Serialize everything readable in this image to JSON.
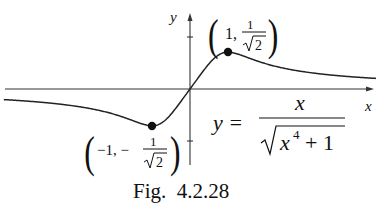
{
  "chart_data": {
    "type": "line",
    "title": "",
    "caption": "Fig.  4.2.28",
    "equation": "y = x / sqrt(x^4 + 1)",
    "xlabel": "x",
    "ylabel": "y",
    "xlim": [
      -4.9,
      4.9
    ],
    "ylim": [
      -1.45,
      1.45
    ],
    "grid": false,
    "y_ticks": [
      -1,
      1
    ],
    "series": [
      {
        "name": "y = x/sqrt(x^4+1)",
        "x": [
          -4.9,
          -4,
          -3,
          -2,
          -1.5,
          -1,
          -0.5,
          0,
          0.5,
          1,
          1.5,
          2,
          3,
          4,
          4.9
        ],
        "y": [
          -0.204,
          -0.248,
          -0.329,
          -0.485,
          -0.555,
          -0.707,
          -0.485,
          0,
          0.485,
          0.707,
          0.555,
          0.485,
          0.329,
          0.248,
          0.204
        ]
      }
    ],
    "marked_points": [
      {
        "x": 1,
        "y": 0.7071,
        "label": "(1, 1/√2)"
      },
      {
        "x": -1,
        "y": -0.7071,
        "label": "(−1, −1/√2)"
      }
    ]
  },
  "labels": {
    "x_axis": "x",
    "y_axis": "y",
    "max_point": {
      "open": "(",
      "a": "1,",
      "num": "1",
      "den": "2",
      "close": ")"
    },
    "min_point": {
      "open": "(",
      "a": "−1, −",
      "num": "1",
      "den": "2",
      "close": ")"
    },
    "equation": {
      "lhs": "y =",
      "num": "x",
      "den_base": "x",
      "den_exp": "4",
      "den_rest": "+ 1"
    },
    "caption": "Fig.  4.2.28"
  }
}
